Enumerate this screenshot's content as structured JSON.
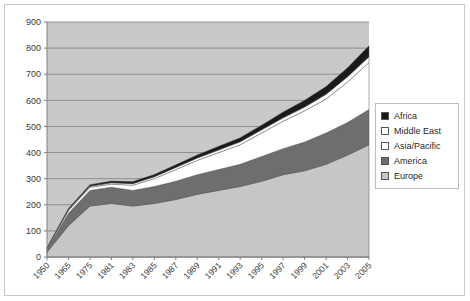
{
  "chart_data": {
    "type": "area",
    "stacked": true,
    "title": "",
    "xlabel": "",
    "ylabel": "",
    "ylim": [
      0,
      900
    ],
    "y_ticks": [
      0,
      100,
      200,
      300,
      400,
      500,
      600,
      700,
      800,
      900
    ],
    "grid": true,
    "legend_position": "right",
    "categories": [
      "1950",
      "1965",
      "1975",
      "1981",
      "1983",
      "1985",
      "1987",
      "1989",
      "1991",
      "1993",
      "1995",
      "1997",
      "1999",
      "2001",
      "2003",
      "2005"
    ],
    "x_tick_labels": [
      "1950",
      "1965",
      "1975",
      "1981",
      "1983",
      "1985",
      "1987",
      "1989",
      "1991",
      "1993",
      "1995",
      "1997",
      "1999",
      "2001",
      "2003",
      "2005"
    ],
    "series": [
      {
        "name": "Europe",
        "color": "#c6c6c6",
        "values": [
          18,
          120,
          195,
          205,
          195,
          205,
          220,
          240,
          255,
          270,
          290,
          315,
          330,
          355,
          390,
          430
        ]
      },
      {
        "name": "America",
        "color": "#6e6e6e",
        "values": [
          12,
          48,
          60,
          62,
          60,
          65,
          70,
          75,
          80,
          85,
          95,
          100,
          110,
          120,
          125,
          135
        ]
      },
      {
        "name": "Asia/Pacific",
        "color": "#ffffff",
        "values": [
          3,
          10,
          12,
          12,
          20,
          30,
          45,
          55,
          65,
          75,
          90,
          105,
          120,
          130,
          155,
          180
        ]
      },
      {
        "name": "Middle East",
        "color": "#ffffff",
        "values": [
          1,
          3,
          4,
          5,
          6,
          7,
          8,
          9,
          10,
          11,
          12,
          13,
          14,
          18,
          20,
          22
        ]
      },
      {
        "name": "Africa",
        "color": "#1a1a1a",
        "values": [
          2,
          5,
          6,
          7,
          8,
          9,
          10,
          12,
          14,
          16,
          18,
          22,
          26,
          30,
          35,
          42
        ]
      }
    ],
    "totals": [
      36,
      186,
      277,
      291,
      289,
      316,
      353,
      391,
      424,
      457,
      505,
      555,
      600,
      653,
      725,
      809
    ]
  },
  "legend": {
    "items": [
      {
        "label": "Africa",
        "color": "#1a1a1a"
      },
      {
        "label": "Middle East",
        "color": "#ffffff"
      },
      {
        "label": "Asia/Pacific",
        "color": "#ffffff"
      },
      {
        "label": "America",
        "color": "#6e6e6e"
      },
      {
        "label": "Europe",
        "color": "#c6c6c6"
      }
    ]
  },
  "axes": {
    "plot_background": "#c9c9c9",
    "gridline_color": "#7d7d7d",
    "axis_color": "#808080"
  }
}
